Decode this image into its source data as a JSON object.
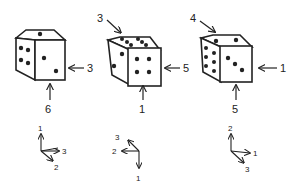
{
  "dice": [
    {
      "id": "die-1",
      "faces": {
        "top_pips": 1,
        "left_pips": 4,
        "front_pips": 2
      },
      "labels": {
        "top": "",
        "right": "3",
        "bottom": "6"
      },
      "axes": {
        "up": "1",
        "right": "3",
        "down_right": "2"
      }
    },
    {
      "id": "die-2",
      "faces": {
        "top_pips": 6,
        "left_pips": 2,
        "front_pips": 4
      },
      "labels": {
        "top": "3",
        "right": "5",
        "bottom": "1"
      },
      "axes": {
        "down": "1",
        "left": "2",
        "up_left": "3"
      }
    },
    {
      "id": "die-3",
      "faces": {
        "top_pips": 2,
        "left_pips": 6,
        "front_pips": 3
      },
      "labels": {
        "top": "4",
        "right": "1",
        "bottom": "5"
      },
      "axes": {
        "up": "2",
        "right": "1",
        "down_right": "3"
      }
    }
  ],
  "colors": {
    "ink": "#222222",
    "background": "#ffffff"
  }
}
